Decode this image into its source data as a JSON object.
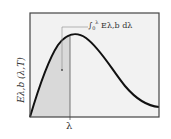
{
  "diagram": {
    "title": "",
    "y_axis_label": "E_{λ,b} (λ,T)",
    "y_axis_label_text": "Eλ,b (λ,T)",
    "x_marker_label": "λ",
    "annotation": {
      "integral_symbol": "∫",
      "upper_limit": "λ",
      "lower_limit": "0",
      "integrand": "Eλ,b dλ",
      "full_text": "∫₀^λ Eλ,b dλ"
    },
    "curve_description": "Planck blackbody spectral emissive power curve",
    "shaded_region": "area under curve from 0 to λ",
    "colors": {
      "curve": "#111111",
      "frame": "#444444",
      "plot_background": "#f2f2f2",
      "shaded_area": "#d9d9d9",
      "marker_line": "#555555"
    }
  }
}
